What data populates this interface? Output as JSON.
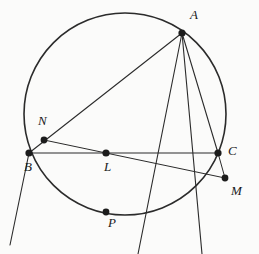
{
  "figure": {
    "name": "circle-geometry-diagram",
    "background_color": "#fbfbfa",
    "stroke_color": "#2b2b2b",
    "point_color": "#1c1c1c",
    "circle": {
      "cx": 125,
      "cy": 114,
      "r": 101,
      "stroke_width": 1.6
    },
    "points": [
      {
        "id": "A",
        "label": "A",
        "x": 182,
        "y": 33,
        "label_x": 190,
        "label_y": 8,
        "r": 3.6
      },
      {
        "id": "N",
        "label": "N",
        "x": 44,
        "y": 140,
        "label_x": 38,
        "label_y": 114,
        "r": 3.4
      },
      {
        "id": "B",
        "label": "B",
        "x": 29,
        "y": 153,
        "label_x": 24,
        "label_y": 160,
        "r": 3.6
      },
      {
        "id": "L",
        "label": "L",
        "x": 106,
        "y": 153,
        "label_x": 104,
        "label_y": 160,
        "r": 3.6
      },
      {
        "id": "C",
        "label": "C",
        "x": 218,
        "y": 153,
        "label_x": 228,
        "label_y": 144,
        "r": 3.6
      },
      {
        "id": "M",
        "label": "M",
        "x": 225,
        "y": 178,
        "label_x": 231,
        "label_y": 184,
        "r": 3.4
      },
      {
        "id": "P",
        "label": "P",
        "x": 106,
        "y": 212,
        "label_x": 108,
        "label_y": 216,
        "r": 3.4
      }
    ],
    "segments": [
      {
        "name": "segment-A-B-through-N",
        "x1": 182,
        "y1": 33,
        "x2": 29,
        "y2": 153,
        "width": 1.1
      },
      {
        "name": "segment-B-L-C",
        "x1": 29,
        "y1": 153,
        "x2": 218,
        "y2": 153,
        "width": 1.1
      },
      {
        "name": "segment-N-to-M",
        "x1": 44,
        "y1": 140,
        "x2": 225,
        "y2": 178,
        "width": 1.0
      },
      {
        "name": "segment-C-to-M",
        "x1": 218,
        "y1": 153,
        "x2": 225,
        "y2": 178,
        "width": 1.0
      },
      {
        "name": "line-A-through-C-extended",
        "x1": 182,
        "y1": 33,
        "x2": 202,
        "y2": 254,
        "width": 1.1
      },
      {
        "name": "line-A-through-P-extended",
        "x1": 182,
        "y1": 33,
        "x2": 138,
        "y2": 254,
        "width": 1.1
      },
      {
        "name": "line-B-extended-downleft",
        "x1": 29,
        "y1": 153,
        "x2": 10,
        "y2": 245,
        "width": 1.1
      },
      {
        "name": "chord-A-to-C",
        "x1": 182,
        "y1": 33,
        "x2": 218,
        "y2": 153,
        "width": 1.1
      }
    ]
  }
}
